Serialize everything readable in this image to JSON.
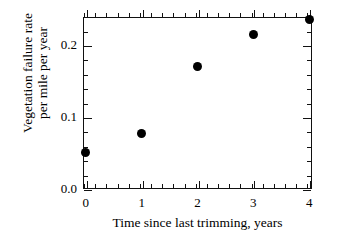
{
  "chart_data": {
    "type": "scatter",
    "title": "",
    "xlabel": "Time since last trimming, years",
    "ylabel_lines": [
      "Vegetation failure rate",
      "per mile per year"
    ],
    "ylabel": "Vegetation failure rate per mile per year",
    "x": [
      0,
      1,
      2,
      3,
      4
    ],
    "values": [
      0.051,
      0.077,
      0.17,
      0.214,
      0.236
    ],
    "points": [
      {
        "x": 0,
        "y": 0.051
      },
      {
        "x": 1,
        "y": 0.077
      },
      {
        "x": 2,
        "y": 0.17
      },
      {
        "x": 3,
        "y": 0.214
      },
      {
        "x": 4,
        "y": 0.236
      }
    ],
    "xlim": [
      -0.05,
      4.05
    ],
    "ylim": [
      0.0,
      0.239
    ],
    "xticks": [
      0,
      1,
      2,
      3,
      4
    ],
    "xtick_labels": [
      "0",
      "1",
      "2",
      "3",
      "4"
    ],
    "yticks": [
      0.0,
      0.1,
      0.2
    ],
    "ytick_labels": [
      "0.0",
      "0.1",
      "0.2"
    ],
    "x_minor_step": 0.2,
    "y_minor_step": 0.02,
    "grid": false,
    "legend": null,
    "marker": {
      "shape": "filled-circle",
      "color": "#000000",
      "size_px": 9
    },
    "axis_color": "#111111",
    "background_color": "#ffffff"
  }
}
